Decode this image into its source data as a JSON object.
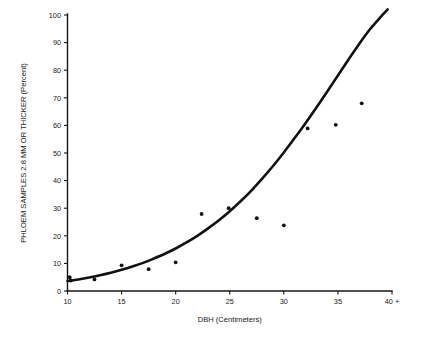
{
  "chart_data": {
    "type": "scatter",
    "title": "",
    "xlabel": "DBH (Centimeters)",
    "ylabel": "PHLOEM SAMPLES 2.8 MM OR THICKER (Percent)",
    "xlim": [
      10,
      40
    ],
    "ylim": [
      0,
      100
    ],
    "grid": false,
    "legend": "none",
    "xticks": [
      10,
      15,
      20,
      25,
      30,
      35,
      40
    ],
    "xticklabels": [
      "10",
      "15",
      "20",
      "25",
      "30",
      "35",
      "40 +"
    ],
    "yticks": [
      0,
      10,
      20,
      30,
      40,
      50,
      60,
      70,
      80,
      90,
      100
    ],
    "yticklabels": [
      "0",
      "10",
      "20",
      "30",
      "40",
      "50",
      "60",
      "70",
      "80",
      "90",
      "100"
    ],
    "point_color": "#111111",
    "curve_color": "#111111",
    "axis_color": "#171717",
    "background_color": "#ffffff",
    "points": [
      {
        "x": 10.2,
        "y": 5.0
      },
      {
        "x": 10.3,
        "y": 3.8
      },
      {
        "x": 12.5,
        "y": 4.2
      },
      {
        "x": 15.0,
        "y": 9.3
      },
      {
        "x": 17.5,
        "y": 7.9
      },
      {
        "x": 20.0,
        "y": 10.4
      },
      {
        "x": 22.4,
        "y": 27.9
      },
      {
        "x": 24.9,
        "y": 30.0
      },
      {
        "x": 27.5,
        "y": 26.4
      },
      {
        "x": 30.0,
        "y": 23.8
      },
      {
        "x": 32.2,
        "y": 58.9
      },
      {
        "x": 34.8,
        "y": 60.2
      },
      {
        "x": 37.2,
        "y": 68.0
      }
    ],
    "curve": {
      "description": "fitted exponential trend line",
      "points": [
        {
          "x": 10.0,
          "y": 3.6
        },
        {
          "x": 11.0,
          "y": 4.2
        },
        {
          "x": 12.0,
          "y": 4.9
        },
        {
          "x": 13.0,
          "y": 5.7
        },
        {
          "x": 14.0,
          "y": 6.6
        },
        {
          "x": 15.0,
          "y": 7.7
        },
        {
          "x": 16.0,
          "y": 8.9
        },
        {
          "x": 17.0,
          "y": 10.2
        },
        {
          "x": 18.0,
          "y": 11.8
        },
        {
          "x": 19.0,
          "y": 13.5
        },
        {
          "x": 20.0,
          "y": 15.4
        },
        {
          "x": 21.0,
          "y": 17.6
        },
        {
          "x": 22.0,
          "y": 20.0
        },
        {
          "x": 23.0,
          "y": 22.7
        },
        {
          "x": 24.0,
          "y": 25.6
        },
        {
          "x": 25.0,
          "y": 28.9
        },
        {
          "x": 26.0,
          "y": 32.5
        },
        {
          "x": 27.0,
          "y": 36.4
        },
        {
          "x": 28.0,
          "y": 40.7
        },
        {
          "x": 29.0,
          "y": 45.3
        },
        {
          "x": 30.0,
          "y": 50.2
        },
        {
          "x": 31.0,
          "y": 55.4
        },
        {
          "x": 32.0,
          "y": 60.8
        },
        {
          "x": 33.0,
          "y": 66.4
        },
        {
          "x": 34.0,
          "y": 72.2
        },
        {
          "x": 35.0,
          "y": 78.1
        },
        {
          "x": 36.0,
          "y": 84.0
        },
        {
          "x": 37.0,
          "y": 89.7
        },
        {
          "x": 38.0,
          "y": 95.0
        },
        {
          "x": 39.0,
          "y": 99.5
        },
        {
          "x": 39.6,
          "y": 102.0
        }
      ]
    }
  }
}
